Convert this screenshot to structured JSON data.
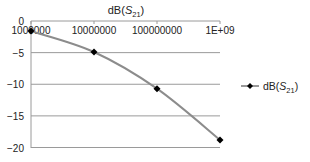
{
  "chart_data": {
    "type": "line",
    "title": "dB(S21)",
    "title_parts": {
      "prefix": "dB(",
      "var": "S",
      "sub": "21",
      "suffix": ")"
    },
    "xlabel": "",
    "ylabel": "",
    "x_scale": "log",
    "categories": [
      "1000000",
      "10000000",
      "100000000",
      "1E+09"
    ],
    "x": [
      1000000,
      10000000,
      100000000,
      1000000000
    ],
    "series": [
      {
        "name": "dB(S21)",
        "values": [
          -1.6,
          -4.9,
          -10.7,
          -18.8
        ],
        "line_color": "#8c8c8c",
        "marker_color": "#000000",
        "marker": "diamond",
        "smooth": true
      }
    ],
    "ylim": [
      -20,
      0
    ],
    "yticks": [
      0,
      -5,
      -10,
      -15,
      -20
    ],
    "ytick_labels": [
      "0",
      "-5",
      "-10",
      "-15",
      "-20"
    ],
    "grid": true,
    "x_axis_position": "top",
    "legend": {
      "position": "right",
      "entries": [
        "dB(S21)"
      ]
    }
  }
}
